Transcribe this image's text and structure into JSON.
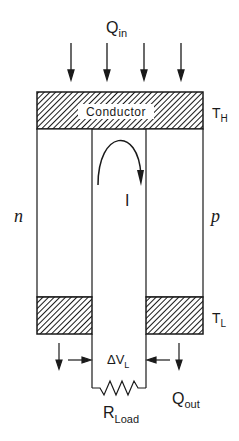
{
  "diagram": {
    "type": "thermoelectric-generator-schematic",
    "labels": {
      "heat_in": {
        "main": "Q",
        "sub": "in"
      },
      "heat_out": {
        "main": "Q",
        "sub": "out"
      },
      "hot_temp": {
        "main": "T",
        "sub": "H"
      },
      "cold_temp": {
        "main": "T",
        "sub": "L"
      },
      "conductor": "Conductor",
      "current": "I",
      "n_leg": "n",
      "p_leg": "p",
      "voltage": {
        "main": "ΔV",
        "sub": "L"
      },
      "load": {
        "main": "R",
        "sub": "Load"
      }
    },
    "components": [
      "top hot-side conductor (hatched)",
      "n-type leg (left)",
      "p-type leg (right)",
      "bottom cold-side conductors (hatched, left and right)",
      "load resistor across bottom terminals",
      "current loop arrow I",
      "four heat-input arrows",
      "two heat-output arrows"
    ],
    "colors": {
      "ink": "#1a1a1a",
      "background": "#ffffff"
    }
  }
}
